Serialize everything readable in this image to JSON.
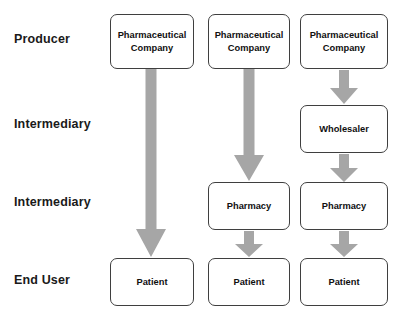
{
  "diagram": {
    "box_fill": "#ffffff",
    "box_border": "#3f3f3f",
    "arrow_color": "#a6a6a6",
    "text_color": "#101010",
    "background": "#ffffff"
  },
  "row_labels": [
    {
      "id": "producer",
      "label": "Producer"
    },
    {
      "id": "intermediary-1",
      "label": "Intermediary"
    },
    {
      "id": "intermediary-2",
      "label": "Intermediary"
    },
    {
      "id": "end-user",
      "label": "End User"
    }
  ],
  "columns": [
    {
      "id": "channel-direct",
      "nodes": [
        {
          "id": "producer",
          "label": "Pharmaceutical\nCompany"
        },
        {
          "id": "end-user",
          "label": "Patient"
        }
      ]
    },
    {
      "id": "channel-pharmacy",
      "nodes": [
        {
          "id": "producer",
          "label": "Pharmaceutical\nCompany"
        },
        {
          "id": "intermediary-2",
          "label": "Pharmacy"
        },
        {
          "id": "end-user",
          "label": "Patient"
        }
      ]
    },
    {
      "id": "channel-wholesaler-pharmacy",
      "nodes": [
        {
          "id": "producer",
          "label": "Pharmaceutical\nCompany"
        },
        {
          "id": "intermediary-1",
          "label": "Wholesaler"
        },
        {
          "id": "intermediary-2",
          "label": "Pharmacy"
        },
        {
          "id": "end-user",
          "label": "Patient"
        }
      ]
    }
  ],
  "arrows": [
    {
      "id": "arrow-col1-producer-to-patient",
      "from": "Pharmaceutical Company",
      "to": "Patient"
    },
    {
      "id": "arrow-col2-producer-to-pharmacy",
      "from": "Pharmaceutical Company",
      "to": "Pharmacy"
    },
    {
      "id": "arrow-col2-pharmacy-to-patient",
      "from": "Pharmacy",
      "to": "Patient"
    },
    {
      "id": "arrow-col3-producer-to-wholesaler",
      "from": "Pharmaceutical Company",
      "to": "Wholesaler"
    },
    {
      "id": "arrow-col3-wholesaler-to-pharmacy",
      "from": "Wholesaler",
      "to": "Pharmacy"
    },
    {
      "id": "arrow-col3-pharmacy-to-patient",
      "from": "Pharmacy",
      "to": "Patient"
    }
  ]
}
